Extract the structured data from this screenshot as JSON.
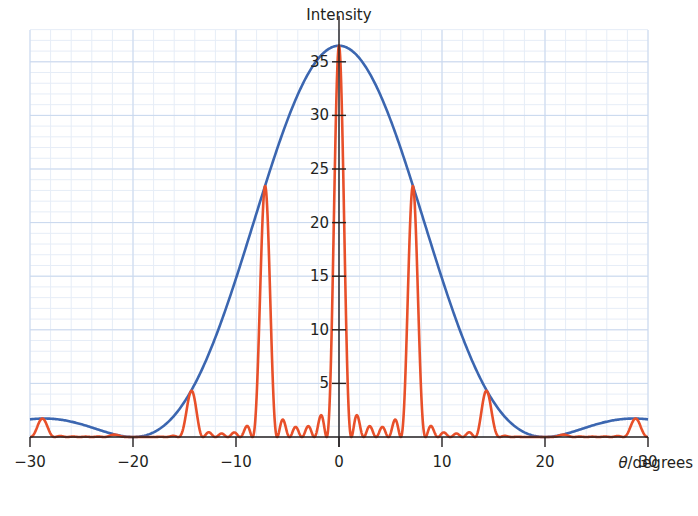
{
  "chart_data": {
    "type": "line",
    "title": "",
    "xlabel": "θ/degrees",
    "ylabel": "Intensity",
    "xlim": [
      -30,
      30
    ],
    "ylim": [
      0,
      38
    ],
    "x_ticks": [
      -30,
      -20,
      -10,
      0,
      10,
      20,
      30
    ],
    "x_tick_labels": [
      "−30",
      "−20",
      "−10",
      "0",
      "10",
      "20",
      "30"
    ],
    "y_ticks": [
      5,
      10,
      15,
      20,
      25,
      30,
      35
    ],
    "y_tick_labels": [
      "5",
      "10",
      "15",
      "20",
      "25",
      "30",
      "35"
    ],
    "grid": {
      "major_x_step": 10,
      "minor_x_step": 2,
      "major_y_step": 5,
      "minor_y_step": 1
    },
    "legend": null,
    "series": [
      {
        "name": "single-slit diffraction envelope",
        "color": "#3b66b0",
        "model": "I0 * sinc^2(pi*theta/20)",
        "I0": 36.5,
        "first_zero_deg": 20,
        "points": [
          [
            -30,
            1.6
          ],
          [
            -28,
            1.6
          ],
          [
            -25,
            1.1
          ],
          [
            -22,
            0.3
          ],
          [
            -20,
            0
          ],
          [
            -18,
            0.4
          ],
          [
            -15,
            3.3
          ],
          [
            -12,
            9.6
          ],
          [
            -10,
            14.8
          ],
          [
            -7.2,
            23.4
          ],
          [
            -5,
            29.6
          ],
          [
            -2.5,
            34.9
          ],
          [
            0,
            36.5
          ],
          [
            2.5,
            34.9
          ],
          [
            5,
            29.6
          ],
          [
            7.2,
            23.4
          ],
          [
            10,
            14.8
          ],
          [
            12,
            9.6
          ],
          [
            15,
            3.3
          ],
          [
            18,
            0.4
          ],
          [
            20,
            0
          ],
          [
            22,
            0.3
          ],
          [
            25,
            1.1
          ],
          [
            28,
            1.6
          ],
          [
            30,
            1.6
          ]
        ]
      },
      {
        "name": "multi-slit interference pattern",
        "color": "#e8502a",
        "model": "envelope * (sin(N*gamma)/(N*sin(gamma)))^2",
        "N": 6,
        "principal_max_spacing_deg": 7.2,
        "principal_maxima": [
          {
            "x": -28.8,
            "y": 1.5
          },
          {
            "x": -21.6,
            "y": 0.3
          },
          {
            "x": -14.4,
            "y": 3.3
          },
          {
            "x": -7.2,
            "y": 22.3
          },
          {
            "x": 0,
            "y": 36.5
          },
          {
            "x": 7.2,
            "y": 22.3
          },
          {
            "x": 14.4,
            "y": 3.3
          },
          {
            "x": 21.6,
            "y": 0.3
          },
          {
            "x": 28.8,
            "y": 1.5
          }
        ],
        "first_subsidiary_max_near_center": 1.8
      }
    ]
  },
  "plot": {
    "width": 698,
    "height": 516,
    "x_px": [
      30,
      648
    ],
    "y_px_zero": 437,
    "y_px_per_unit": 10.72,
    "grid_top_px": 30,
    "colors": {
      "grid_major": "#c9d8ee",
      "grid_minor": "#e6edf7",
      "axis": "#231f20",
      "envelope": "#3b66b0",
      "pattern": "#e8502a"
    }
  }
}
